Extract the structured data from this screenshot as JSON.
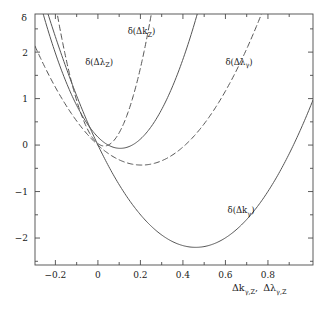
{
  "chart_data": {
    "type": "line",
    "title": "",
    "subtitle": "",
    "xlabel": "Δkγ,Z,  Δλγ,Z",
    "ylabel": "δ",
    "xlim": [
      -0.296,
      1.012
    ],
    "ylim": [
      -2.58,
      2.82
    ],
    "grid": false,
    "legend_position": "inline-annotations",
    "xticks": [
      -0.2,
      0,
      0.2,
      0.4,
      0.6,
      0.8
    ],
    "xtick_labels": [
      "−0.2",
      "0",
      "0.2",
      "0.4",
      "0.6",
      "0.8"
    ],
    "xminor_ticks": [
      -0.3,
      -0.1,
      0.1,
      0.3,
      0.5,
      0.7,
      0.9
    ],
    "yticks": [
      2,
      1,
      0,
      -1,
      -2
    ],
    "ytick_labels": [
      "2",
      "1",
      "0",
      "−1",
      "−2"
    ],
    "yminor_ticks": [
      2.5,
      1.5,
      0.5,
      -0.5,
      -1.5,
      -2.5
    ],
    "series": [
      {
        "name": "δ(Δk_Z)",
        "style": "solid",
        "label": "δ(Δk",
        "label_sub": "Z",
        "label_tail": ")",
        "label_x": 0.14,
        "label_y": 2.38,
        "vertex_x": 0.105,
        "vertex_y": -0.07,
        "curvature": 22.0,
        "points_x": [
          -0.296,
          -0.25,
          -0.2,
          -0.15,
          -0.1,
          -0.05,
          0.0,
          0.05,
          0.105,
          0.15,
          0.2,
          0.25,
          0.3,
          0.32
        ],
        "points_y": [
          35.0,
          27.0,
          20.0,
          14.0,
          9.0,
          5.0,
          0.17,
          0.0,
          -0.07,
          0.36,
          1.14,
          2.3,
          3.8,
          4.6
        ]
      },
      {
        "name": "δ(Δλ_Z)",
        "style": "dashed",
        "label": "δ(Δλ",
        "label_sub": "Z",
        "label_tail": ")",
        "label_x": -0.06,
        "label_y": 1.73,
        "vertex_x": 0.03,
        "vertex_y": -0.02,
        "curvature": 58.0,
        "points_x": [
          -0.296,
          -0.25,
          -0.2,
          -0.15,
          -0.1,
          -0.05,
          0.0,
          0.03,
          0.08,
          0.12,
          0.17,
          0.2
        ],
        "points_y": [
          63.0,
          47.0,
          32.0,
          20.0,
          11.0,
          4.3,
          0.0,
          -0.02,
          0.17,
          0.56,
          1.3,
          1.8
        ]
      },
      {
        "name": "δ(Δλ_γ)",
        "style": "dashed",
        "label": "δ(Δλ",
        "label_sub": "γ",
        "label_tail": ")",
        "label_x": 0.6,
        "label_y": 1.73,
        "vertex_x": 0.205,
        "vertex_y": -0.43,
        "curvature": 10.2,
        "points_x": [
          -0.296,
          -0.25,
          -0.2,
          -0.15,
          -0.1,
          -0.05,
          0.0,
          0.1,
          0.205,
          0.3,
          0.4,
          0.5,
          0.6,
          0.65
        ],
        "points_y": [
          16.0,
          12.2,
          9.0,
          6.3,
          4.1,
          2.2,
          0.0,
          -0.32,
          -0.43,
          -0.33,
          0.08,
          0.8,
          1.9,
          2.6
        ]
      },
      {
        "name": "δ(Δk_γ)",
        "style": "solid",
        "label": "δ(Δk",
        "label_sub": "γ",
        "label_tail": ")",
        "label_x": 0.61,
        "label_y": -1.47,
        "vertex_x": 0.46,
        "vertex_y": -2.2,
        "curvature": 10.4,
        "points_x": [
          -0.296,
          -0.2,
          -0.1,
          0.0,
          0.1,
          0.2,
          0.3,
          0.46,
          0.6,
          0.7,
          0.8,
          0.9,
          1.0,
          1.012
        ],
        "points_y": [
          3.8,
          2.0,
          0.9,
          0.0,
          -0.85,
          -1.5,
          -1.93,
          -2.2,
          -2.0,
          -1.6,
          -1.0,
          -0.3,
          0.15,
          0.18
        ]
      }
    ]
  },
  "axes": {
    "y_axis_symbol": "δ",
    "x_axis_label_main1": "Δk",
    "x_axis_label_sub1": "γ,Z",
    "x_axis_comma": ",",
    "x_axis_label_main2": "Δλ",
    "x_axis_label_sub2": "γ,Z"
  },
  "colors": {
    "frame": "#4a4a4a",
    "curve": "#555555",
    "text": "#1a1a1a",
    "background": "#ffffff"
  }
}
